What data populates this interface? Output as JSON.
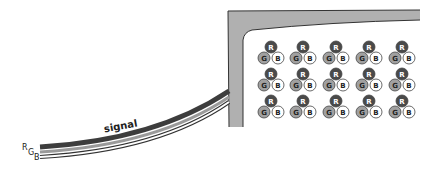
{
  "diagram": {
    "cable": {
      "label": "signal",
      "channels": [
        {
          "id": "R",
          "label": "R",
          "color": "#3d3d3d"
        },
        {
          "id": "G",
          "label": "G",
          "color": "#9a9a9a"
        },
        {
          "id": "B",
          "label": "B",
          "color": "#ffffff"
        }
      ]
    },
    "screen": {
      "frame_color": "#b0b0b0",
      "outline_color": "#333333",
      "background": "#ffffff"
    },
    "pixel_grid": {
      "rows": 3,
      "columns": 5,
      "subpixels": [
        {
          "label": "R",
          "fill": "#4a4a4a",
          "text": "#ffffff"
        },
        {
          "label": "G",
          "fill": "#a0a0a0",
          "text": "#222222"
        },
        {
          "label": "B",
          "fill": "#ffffff",
          "text": "#222222"
        }
      ]
    }
  }
}
